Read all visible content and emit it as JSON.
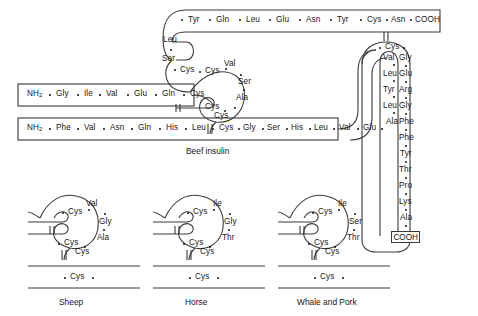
{
  "figure": {
    "title": "Beef insulin",
    "main_label": "Beef insulin",
    "terminus_n": "NH2",
    "terminus_c": "COOH",
    "dot_separator": "•"
  },
  "chains": {
    "a_chain_top": {
      "name": "A chain C-terminal segment",
      "residues": [
        "Tyr",
        "Gln",
        "Leu",
        "Glu",
        "Asn",
        "Tyr",
        "Cys",
        "Asn"
      ],
      "terminus": "COOH"
    },
    "a_chain_left_curve": {
      "name": "A chain N-terminal curve",
      "residues": [
        "Leu",
        "Ser",
        "Cys"
      ]
    },
    "a_chain_upper_left_start": {
      "name": "A chain start label",
      "residues": [
        "NH2",
        "Gly",
        "Ile",
        "Val",
        "Glu",
        "Gln",
        "Cys"
      ]
    },
    "b_chain_bottom": {
      "name": "B chain N-terminal segment",
      "residues": [
        "NH2",
        "Phe",
        "Val",
        "Asn",
        "Gln",
        "His",
        "Leu",
        "Cys",
        "Gly",
        "Ser",
        "His",
        "Leu",
        "Val",
        "Glu",
        "Ala"
      ]
    },
    "b_chain_right_curve": {
      "name": "B chain ascending curve",
      "residues": [
        "Leu",
        "Tyr",
        "Leu",
        "Val"
      ]
    },
    "b_chain_hairpin_top": {
      "name": "B chain hairpin apex",
      "residues": [
        "Cys"
      ]
    },
    "b_chain_right_descending": {
      "name": "B chain C-terminal segment",
      "residues": [
        "Gly",
        "Glu",
        "Arg",
        "Gly",
        "Phe",
        "Phe",
        "Tyr",
        "Thr",
        "Pro",
        "Lys",
        "Ala"
      ],
      "terminus": "COOH"
    },
    "interchain_loop": {
      "name": "Beef variable loop",
      "residues": [
        "Cys",
        "Val",
        "Ser",
        "Ala",
        "Cys",
        "Cys"
      ]
    }
  },
  "species_panels": [
    {
      "caption": "Sheep",
      "variable_residues": [
        "Val",
        "Gly",
        "Ala"
      ],
      "cystines": [
        "Cys",
        "Cys",
        "Cys",
        "Cys"
      ]
    },
    {
      "caption": "Horse",
      "variable_residues": [
        "Ile",
        "Gly",
        "Thr"
      ],
      "cystines": [
        "Cys",
        "Cys",
        "Cys",
        "Cys"
      ]
    },
    {
      "caption": "Whale and Pork",
      "variable_residues": [
        "Ile",
        "Ser",
        "Thr"
      ],
      "cystines": [
        "Cys",
        "Cys",
        "Cys",
        "Cys"
      ]
    }
  ],
  "colors": {
    "ink": "#161616",
    "line": "#3a3a3a",
    "background": "#ffffff"
  }
}
